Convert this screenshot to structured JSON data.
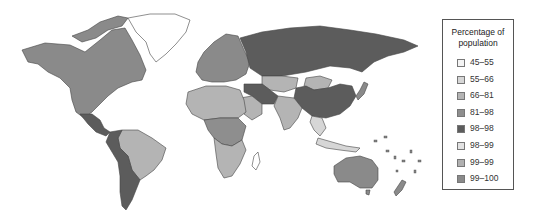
{
  "legend": {
    "title_line1": "Percentage of",
    "title_line2": "population",
    "items": [
      {
        "label": "45–55",
        "color": "#f4f4f4"
      },
      {
        "label": "55–66",
        "color": "#d6d6d6"
      },
      {
        "label": "66–81",
        "color": "#b4b4b4"
      },
      {
        "label": "81–98",
        "color": "#8e8e8e"
      },
      {
        "label": "98–98",
        "color": "#5c5c5c"
      },
      {
        "label": "98–99",
        "color": "#e2e2e2"
      },
      {
        "label": "99–99",
        "color": "#b0b0b0"
      },
      {
        "label": "99–100",
        "color": "#8a8a8a"
      }
    ]
  },
  "map": {
    "regions": [
      {
        "name": "north-america",
        "color": "#8a8a8a"
      },
      {
        "name": "greenland",
        "color": "#ffffff"
      },
      {
        "name": "central-america",
        "color": "#5c5c5c"
      },
      {
        "name": "brazil",
        "color": "#b4b4b4"
      },
      {
        "name": "southern-cone",
        "color": "#5c5c5c"
      },
      {
        "name": "europe",
        "color": "#8a8a8a"
      },
      {
        "name": "russia",
        "color": "#5c5c5c"
      },
      {
        "name": "kazakhstan",
        "color": "#b4b4b4"
      },
      {
        "name": "mongolia",
        "color": "#b4b4b4"
      },
      {
        "name": "china",
        "color": "#5c5c5c"
      },
      {
        "name": "middle-east",
        "color": "#5c5c5c"
      },
      {
        "name": "india",
        "color": "#b4b4b4"
      },
      {
        "name": "north-africa",
        "color": "#b4b4b4"
      },
      {
        "name": "central-africa",
        "color": "#8e8e8e"
      },
      {
        "name": "southern-africa",
        "color": "#b4b4b4"
      },
      {
        "name": "southeast-asia",
        "color": "#d6d6d6"
      },
      {
        "name": "australia",
        "color": "#8a8a8a"
      },
      {
        "name": "new-zealand",
        "color": "#8a8a8a"
      },
      {
        "name": "japan",
        "color": "#8a8a8a"
      }
    ]
  }
}
